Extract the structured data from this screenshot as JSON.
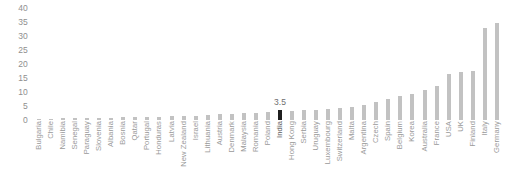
{
  "chart_data": {
    "type": "bar",
    "title": "",
    "subtitle": "",
    "xlabel": "",
    "ylabel": "",
    "ylim": [
      0,
      40
    ],
    "yticks": [
      0,
      5,
      10,
      15,
      20,
      25,
      30,
      35,
      40
    ],
    "grid": false,
    "legend": null,
    "orientation": "vertical",
    "sorted": "ascending",
    "highlight_category": "India",
    "highlight_color": "#1f1f1f",
    "bar_color": "#c2c2c2",
    "categories": [
      "Bulgaria",
      "Chile",
      "Namibia",
      "Senegal",
      "Paraguay",
      "Slovenia",
      "Albania",
      "Bosnia",
      "Qatar",
      "Portugal",
      "Honduras",
      "Latvia",
      "New Zealand",
      "Israel",
      "Lithuania",
      "Austria",
      "Denmark",
      "Malaysia",
      "Romania",
      "Poland",
      "India",
      "Hong Kong",
      "Serbia",
      "Uruguay",
      "Luxembourg",
      "Switzerland",
      "Malta",
      "Argentina",
      "Czech",
      "Spain",
      "Belgium",
      "Korea",
      "Australia",
      "France",
      "USA",
      "UK",
      "Finland",
      "Italy",
      "Germany"
    ],
    "values": [
      0.5,
      0.5,
      0.6,
      0.6,
      0.7,
      0.7,
      0.8,
      0.9,
      1.0,
      1.1,
      1.2,
      1.3,
      1.4,
      1.6,
      1.8,
      2.0,
      2.2,
      2.4,
      2.6,
      2.9,
      3.5,
      3.2,
      3.4,
      3.6,
      4.0,
      4.4,
      4.8,
      5.4,
      6.4,
      7.6,
      8.4,
      9.4,
      10.6,
      12.0,
      16.6,
      17.0,
      17.4,
      33.0,
      34.5
    ],
    "annotations": [
      {
        "category": "India",
        "text": "3.5"
      }
    ]
  }
}
